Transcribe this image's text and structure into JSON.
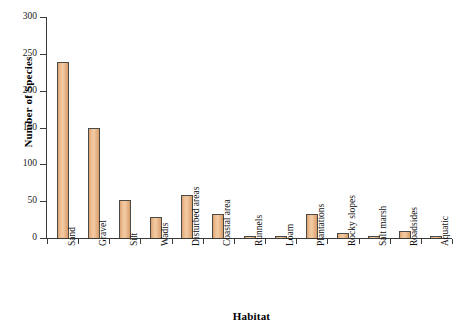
{
  "chart_data": {
    "type": "bar",
    "title": "",
    "xlabel": "Habitat",
    "ylabel": "Number of Species",
    "ylim": [
      0,
      300
    ],
    "ytick_step": 50,
    "yticks": [
      0,
      50,
      100,
      150,
      200,
      250,
      300
    ],
    "grid": false,
    "legend": null,
    "bar_fill_color": "#EEBE92",
    "bar_edge_color": "#4A4A48",
    "axis_color": "#3A3A3A",
    "categories": [
      "Sand",
      "Gravel",
      "Silt",
      "Wadis",
      "Disturbed areas",
      "Coastal area",
      "Runnels",
      "Loam",
      "Plantations",
      "Rocky slopes",
      "Salt marsh",
      "Roadsides",
      "Aquatic"
    ],
    "values": [
      239,
      150,
      52,
      28,
      59,
      33,
      2,
      2,
      33,
      7,
      2,
      10,
      1
    ]
  }
}
